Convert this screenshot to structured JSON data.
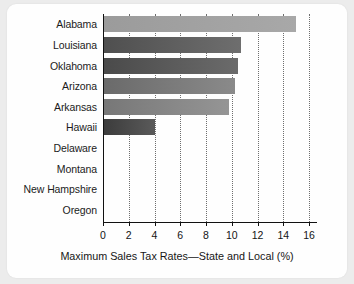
{
  "chart_data": {
    "type": "bar",
    "orientation": "horizontal",
    "title": "",
    "xlabel": "Maximum Sales Tax Rates—State and Local (%)",
    "ylabel": "",
    "categories": [
      "Alabama",
      "Louisiana",
      "Oklahoma",
      "Arizona",
      "Arkansas",
      "Hawaii",
      "Delaware",
      "Montana",
      "New Hampshire",
      "Oregon"
    ],
    "values": [
      15.0,
      10.75,
      10.5,
      10.25,
      9.75,
      4.0,
      0,
      0,
      0,
      0
    ],
    "xlim": [
      0,
      16
    ],
    "xticks": [
      0,
      2,
      4,
      6,
      8,
      10,
      12,
      14,
      16
    ],
    "xtick_labels": [
      "0",
      "2",
      "4",
      "6",
      "8",
      "10",
      "12",
      "14",
      "16"
    ],
    "grid": true,
    "grid_axis": "x",
    "grid_style": "dotted",
    "legend": false,
    "bar_colors": [
      "#9b9b9b",
      "#4f4f4f",
      "#4a4a4a",
      "#6a6a6a",
      "#777777",
      "#3b3b3b",
      "#808080",
      "#808080",
      "#808080",
      "#808080"
    ],
    "bar_colors_end": [
      "#a8a8a8",
      "#6e6e6e",
      "#6b6b6b",
      "#8a8a8a",
      "#959595",
      "#5a5a5a",
      "#808080",
      "#808080",
      "#808080",
      "#808080"
    ]
  },
  "colors": {
    "page_background": "#ececec",
    "card_background": "#fefefe",
    "axis": "#111111",
    "gridline": "#6e6e6e",
    "text": "#1b1b1b"
  }
}
